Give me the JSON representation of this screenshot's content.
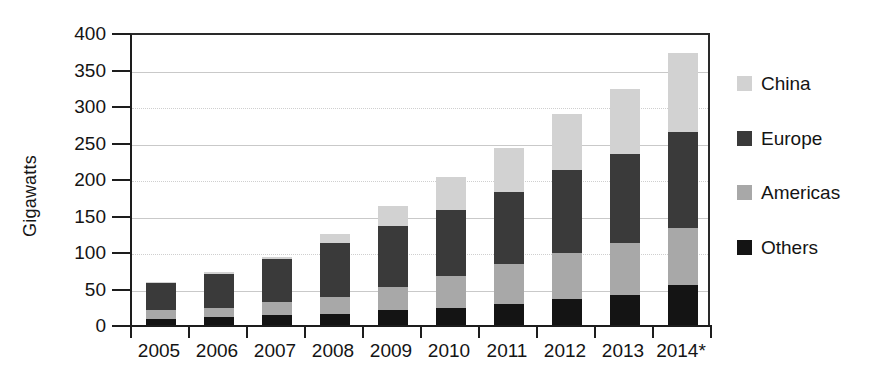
{
  "chart_data": {
    "type": "bar",
    "subtype": "stacked-vertical",
    "title": "",
    "xlabel": "",
    "ylabel": "Gigawatts",
    "ylim": [
      0,
      400
    ],
    "ytick_step": 50,
    "yticks": [
      "400",
      "350",
      "300",
      "250",
      "200",
      "150",
      "100",
      "50",
      "0"
    ],
    "grid": true,
    "legend_position": "right",
    "categories": [
      "2005",
      "2006",
      "2007",
      "2008",
      "2009",
      "2010",
      "2011",
      "2012",
      "2013",
      "2014*"
    ],
    "stack_order_bottom_to_top": [
      "Others",
      "Americas",
      "Europe",
      "China"
    ],
    "series": [
      {
        "name": "Others",
        "color": "#141414",
        "values": [
          8,
          11,
          14,
          15,
          20,
          23,
          29,
          35,
          41,
          55
        ]
      },
      {
        "name": "Americas",
        "color": "#a8a8a8",
        "values": [
          12,
          12,
          17,
          24,
          32,
          44,
          54,
          63,
          72,
          78
        ]
      },
      {
        "name": "Europe",
        "color": "#3a3a3a",
        "values": [
          37,
          47,
          60,
          74,
          84,
          91,
          99,
          115,
          121,
          132
        ]
      },
      {
        "name": "China",
        "color": "#d2d2d2",
        "values": [
          2,
          2,
          2,
          12,
          27,
          45,
          60,
          76,
          89,
          107
        ]
      }
    ],
    "totals": [
      59,
      72,
      93,
      125,
      163,
      203,
      242,
      289,
      323,
      372
    ]
  },
  "legend": {
    "items": [
      {
        "label": "China",
        "color": "#d2d2d2"
      },
      {
        "label": "Europe",
        "color": "#3a3a3a"
      },
      {
        "label": "Americas",
        "color": "#a8a8a8"
      },
      {
        "label": "Others",
        "color": "#141414"
      }
    ]
  }
}
